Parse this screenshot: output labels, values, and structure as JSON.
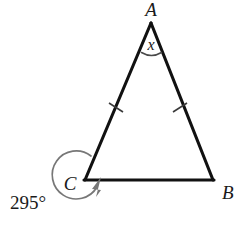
{
  "figure": {
    "type": "geometry-diagram",
    "shape": "isosceles-triangle",
    "background_color": "#ffffff",
    "line_color": "#111111",
    "arc_color": "#777777",
    "tick_color": "#3a3a3a",
    "vertices": [
      {
        "name": "A",
        "label": "A",
        "position": "apex-top",
        "x": 151,
        "y": 21
      },
      {
        "name": "B",
        "label": "B",
        "position": "bottom-right",
        "x": 213,
        "y": 180
      },
      {
        "name": "C",
        "label": "C",
        "position": "bottom-left",
        "x": 85,
        "y": 180
      }
    ],
    "angles": [
      {
        "at": "A",
        "label": "x",
        "kind": "unknown-variable",
        "arc": "single"
      },
      {
        "at": "C",
        "label": "295°",
        "kind": "reflex-angle",
        "arc": "reflex-with-arrow"
      }
    ],
    "congruence_marks": [
      {
        "side": "AC",
        "ticks": 1
      },
      {
        "side": "AB",
        "ticks": 1
      }
    ],
    "labels": {
      "apex": "A",
      "bottom_right": "B",
      "bottom_left": "C",
      "unknown_angle": "x",
      "reflex_angle": "295°"
    }
  }
}
